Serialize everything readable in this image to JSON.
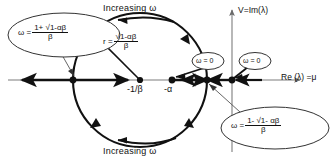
{
  "figure": {
    "type": "complex-plane-root-locus",
    "axes": {
      "vertical_label": "V=Im(λ)",
      "horizontal_label": "Re (λ) =μ"
    },
    "circle": {
      "center_label": "-1/β",
      "radius_label_prefix": "r =",
      "radius_numerator": "√1-αβ",
      "radius_denominator": "β",
      "center_px": {
        "x": 140,
        "y": 80
      },
      "radius_px": 67
    },
    "point_labels": [
      {
        "name": "circle-center",
        "text": "-1/β"
      },
      {
        "name": "minus-alpha",
        "text": "-α"
      }
    ],
    "direction_labels": {
      "top": "Increasing ω",
      "bottom": "Increasing ω"
    },
    "callouts": [
      {
        "name": "omega-plus-branch",
        "lead": "ω =",
        "numerator": "1+ √1-αβ",
        "denominator": "β"
      },
      {
        "name": "omega-minus-branch",
        "lead": "ω =",
        "numerator": "1- √1- αβ",
        "denominator": "β"
      }
    ],
    "omega_zero_badges": [
      {
        "name": "omega-zero-inner",
        "text": "ω = 0"
      },
      {
        "name": "omega-zero-origin",
        "text": "ω = 0"
      }
    ],
    "colors": {
      "ink": "#111111",
      "axis": "#6a6a6a",
      "background": "#ffffff"
    }
  }
}
